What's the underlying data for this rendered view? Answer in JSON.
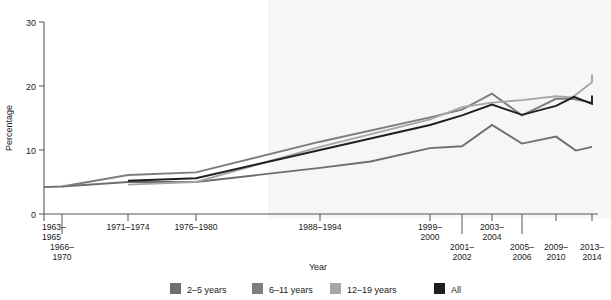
{
  "chart_data": {
    "type": "line",
    "title": "",
    "xlabel": "Year",
    "ylabel": "Percentage",
    "ylim": [
      0,
      30
    ],
    "yticks": [
      0,
      10,
      20,
      30
    ],
    "ytick_labels": [
      "0",
      "10",
      "20",
      "30"
    ],
    "grid": false,
    "legend_position": "bottom",
    "categories": [
      "1963–1965",
      "1966–1970",
      "1971–1974",
      "1976–1980",
      "1988–1994",
      "1999–2000",
      "2001–2002",
      "2003–2004",
      "2005–2006",
      "2009–2010",
      "2013–2014"
    ],
    "series": [
      {
        "name": "2–5 years",
        "color": "#6e6e6e",
        "values": [
          4.2,
          4.3,
          5.0,
          5.0,
          7.2,
          10.3,
          10.6,
          13.9,
          11.0,
          12.1,
          10.5
        ]
      },
      {
        "name": "6–11 years",
        "color": "#7d7d7d",
        "values": [
          null,
          4.3,
          6.1,
          6.5,
          11.3,
          15.1,
          16.3,
          18.8,
          15.4,
          18.0,
          17.4
        ]
      },
      {
        "name": "12–19 years",
        "color": "#a6a6a6",
        "values": [
          null,
          null,
          4.6,
          5.0,
          10.5,
          14.8,
          16.7,
          17.4,
          17.8,
          18.4,
          20.6
        ]
      },
      {
        "name": "All",
        "color": "#1f1f1f",
        "values": [
          null,
          null,
          5.2,
          5.6,
          10.0,
          13.9,
          15.4,
          17.1,
          15.5,
          16.9,
          17.2
        ]
      }
    ],
    "series_extra_points": {
      "2–5 years": [
        [
          4.46,
          8.2
        ],
        [
          9.55,
          9.9
        ]
      ],
      "6–11 years": [
        [
          9.45,
          18.0
        ]
      ],
      "12–19 years": [
        [
          9.45,
          18.2
        ],
        [
          10.0,
          21.8
        ]
      ],
      "All": [
        [
          9.5,
          18.3
        ],
        [
          10.0,
          18.5
        ]
      ]
    }
  },
  "legend": {
    "items": [
      {
        "label": "2–5 years",
        "color": "#6e6e6e"
      },
      {
        "label": "6–11 years",
        "color": "#7d7d7d"
      },
      {
        "label": "12–19 years",
        "color": "#a6a6a6"
      },
      {
        "label": "All",
        "color": "#1f1f1f"
      }
    ]
  },
  "axes": {
    "y_title": "Percentage",
    "x_title": "Year",
    "y_tick_labels": [
      "30",
      "20",
      "10",
      "0"
    ],
    "x_tick_labels": [
      {
        "line1": "1963–",
        "line2": "1965"
      },
      {
        "line1": "1966–",
        "line2": "1970"
      },
      {
        "line1": "1971–1974",
        "line2": ""
      },
      {
        "line1": "1976–1980",
        "line2": ""
      },
      {
        "line1": "1988–1994",
        "line2": ""
      },
      {
        "line1": "1999–",
        "line2": "2000"
      },
      {
        "line1": "2001–",
        "line2": "2002"
      },
      {
        "line1": "2003–",
        "line2": "2004"
      },
      {
        "line1": "2005–",
        "line2": "2006"
      },
      {
        "line1": "2009–",
        "line2": "2010"
      },
      {
        "line1": "2013–",
        "line2": "2014"
      }
    ]
  }
}
